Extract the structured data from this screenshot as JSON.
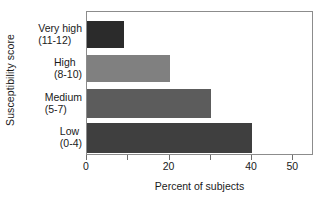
{
  "chart_data": {
    "type": "bar",
    "orientation": "horizontal",
    "title": "",
    "xlabel": "Percent of subjects",
    "ylabel": "Susceptibility score",
    "categories": [
      "Very high\n(11-12)",
      "High\n(8-10)",
      "Medium\n(5-7)",
      "Low\n(0-4)"
    ],
    "category_lines": [
      {
        "line1": "Very high",
        "line2": "(11-12)"
      },
      {
        "line1": "High",
        "line2": "(8-10)"
      },
      {
        "line1": "Medium",
        "line2": "(5-7)"
      },
      {
        "line1": "Low",
        "line2": "(0-4)"
      }
    ],
    "values": [
      9,
      20,
      30,
      40
    ],
    "bar_colors": [
      "#2b2b2b",
      "#808080",
      "#5c5c5c",
      "#3f3f3f"
    ],
    "xlim": [
      0,
      55
    ],
    "xticks": [
      0,
      10,
      20,
      30,
      40,
      50
    ],
    "xtick_labels": [
      "0",
      "",
      "20",
      "",
      "40",
      "50"
    ],
    "grid": false,
    "legend": null,
    "frame_color": "#8c8c8c"
  },
  "axes": {
    "x_title": "Percent of subjects",
    "y_title": "Susceptibility score",
    "tick_labels": [
      "0",
      "20",
      "40",
      "50"
    ]
  }
}
